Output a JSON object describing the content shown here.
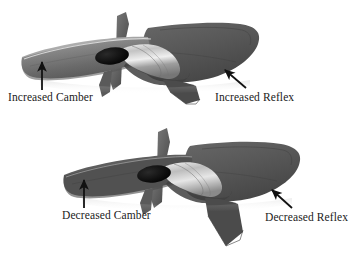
{
  "figure": {
    "background_color": "#ffffff",
    "width": 354,
    "height": 268
  },
  "labels": {
    "increased_camber": "Increased Camber",
    "increased_reflex": "Increased Reflex",
    "decreased_camber": "Decreased Camber",
    "decreased_reflex": "Decreased Reflex"
  },
  "annotations": [
    {
      "name": "increased-camber",
      "text": "Increased Camber",
      "arrow_direction": "up",
      "points_at": "left wing leading edge of upper aircraft"
    },
    {
      "name": "increased-reflex",
      "text": "Increased Reflex",
      "arrow_direction": "up-left",
      "points_at": "right wing trailing edge of upper aircraft"
    },
    {
      "name": "decreased-camber",
      "text": "Decreased Camber",
      "arrow_direction": "up",
      "points_at": "left wing leading edge of lower aircraft"
    },
    {
      "name": "decreased-reflex",
      "text": "Decreased Reflex",
      "arrow_direction": "up-left",
      "points_at": "right wing trailing edge of lower aircraft"
    }
  ],
  "aircraft": [
    {
      "name": "upper-aircraft",
      "state": "increased",
      "parts": [
        "left-wing",
        "right-wing",
        "fuselage-canopy",
        "propeller",
        "spinner",
        "ventral-fin",
        "vertical-fin"
      ]
    },
    {
      "name": "lower-aircraft",
      "state": "decreased",
      "parts": [
        "left-wing",
        "right-wing",
        "fuselage-canopy",
        "propeller",
        "spinner",
        "ventral-fin",
        "vertical-fin"
      ]
    }
  ],
  "colors": {
    "background": "#ffffff",
    "wing_dark": "#4e4e4e",
    "wing_mid": "#6f6f6f",
    "wing_light": "#9a9a9a",
    "wing_highlight": "#c9c9c9",
    "canopy_light": "#d8d8d8",
    "canopy_mid": "#a8a8a8",
    "spinner_black": "#0d0d0d",
    "arrow": "#111111",
    "text": "#1a1a1a"
  }
}
